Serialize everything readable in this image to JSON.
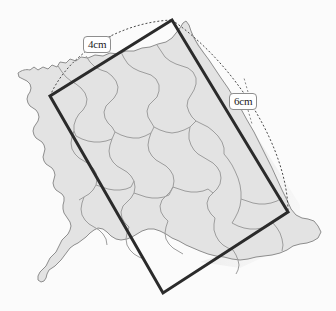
{
  "figure": {
    "background_color": "#fbfbfb"
  },
  "labels": [
    {
      "name": "width-label",
      "text": "4cm",
      "side": "top-left-edge"
    },
    {
      "name": "height-label",
      "text": "6cm",
      "side": "top-right-edge"
    }
  ],
  "rectangle": {
    "stroke_color": "#2b2b2b",
    "stroke_width": 3,
    "fill": "none",
    "corners": {
      "top": [
        172,
        20
      ],
      "left": [
        50,
        96
      ],
      "bottom": [
        163,
        293
      ],
      "right": [
        288,
        212
      ]
    }
  },
  "arcs": {
    "stroke_color": "#4a4a4a",
    "dash": "2 2",
    "short_side_arc": "bows outward above the 4cm edge",
    "long_side_arc": "bows outward right of the 6cm edge"
  },
  "map": {
    "fill_color": "#e3e3e3",
    "outline_color": "#8a8a8a",
    "internal_border_color": "#9a9a9a",
    "description": "irregular administrative map region with internal subdivision boundaries"
  }
}
